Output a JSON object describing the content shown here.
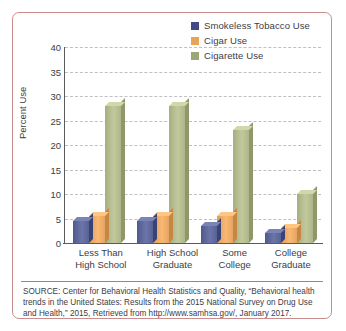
{
  "chart_data": {
    "type": "bar",
    "title": "",
    "xlabel": "",
    "ylabel": "Percent Use",
    "ylim": [
      0,
      40
    ],
    "yticks": [
      0,
      5,
      10,
      15,
      20,
      25,
      30,
      35,
      40
    ],
    "grid": true,
    "legend_position": "top-right",
    "categories": [
      "Less Than\nHigh School",
      "High School\nGraduate",
      "Some\nCollege",
      "College\nGraduate"
    ],
    "category_lines": [
      [
        "Less Than",
        "High School"
      ],
      [
        "High School",
        "Graduate"
      ],
      [
        "Some",
        "College"
      ],
      [
        "College",
        "Graduate"
      ]
    ],
    "series": [
      {
        "name": "Smokeless Tobacco Use",
        "color": "#5b6598",
        "values": [
          4.5,
          4.5,
          3.5,
          2.0
        ]
      },
      {
        "name": "Cigar Use",
        "color": "#e9a864",
        "values": [
          5.5,
          5.5,
          5.5,
          3.0
        ]
      },
      {
        "name": "Cigarette Use",
        "color": "#b2b98c",
        "values": [
          28.0,
          28.0,
          23.0,
          10.0
        ]
      }
    ]
  },
  "legend": {
    "items": [
      {
        "label": "Smokeless Tobacco Use",
        "color": "#3f4a86"
      },
      {
        "label": "Cigar Use",
        "color": "#e8a455"
      },
      {
        "label": "Cigarette Use",
        "color": "#9aa877"
      }
    ]
  },
  "axis": {
    "y_label": "Percent Use",
    "y_ticks": [
      "40",
      "35",
      "30",
      "25",
      "20",
      "15",
      "10",
      "5",
      "0"
    ]
  },
  "source": {
    "text": "SOURCE: Center for Behavioral Health Statistics and Quality, “Behavioral health trends in the United States: Results from the 2015 National Survey on Drug Use and Health,” 2015, Retrieved from http://www.samhsa.gov/, January 2017."
  },
  "colors": {
    "frame": "#c98d8d",
    "grid": "#bfbfc6",
    "axis": "#5a5a5a",
    "text": "#3c3c46"
  }
}
